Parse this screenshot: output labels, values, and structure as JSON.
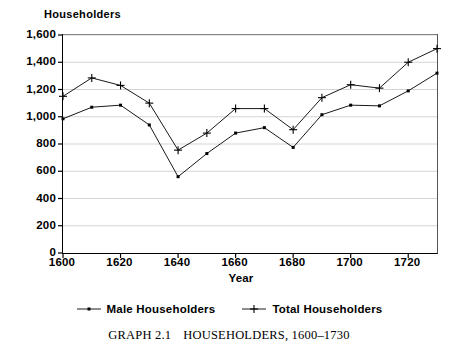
{
  "chart_data": {
    "type": "line",
    "title": "",
    "ylabel": "Householders",
    "xlabel": "Year",
    "xlim": [
      1600,
      1730
    ],
    "ylim": [
      0,
      1600
    ],
    "grid": true,
    "legend_position": "bottom",
    "x": [
      1600,
      1610,
      1620,
      1630,
      1640,
      1650,
      1660,
      1670,
      1680,
      1690,
      1700,
      1710,
      1720,
      1730
    ],
    "xticks": [
      "1600",
      "1620",
      "1640",
      "1660",
      "1680",
      "1700",
      "1720"
    ],
    "xtick_values": [
      1600,
      1620,
      1640,
      1660,
      1680,
      1700,
      1720
    ],
    "yticks": [
      "0",
      "200",
      "400",
      "600",
      "800",
      "1,000",
      "1,200",
      "1,400",
      "1,600"
    ],
    "ytick_values": [
      0,
      200,
      400,
      600,
      800,
      1000,
      1200,
      1400,
      1600
    ],
    "series": [
      {
        "name": "Male Householders",
        "marker": "dot",
        "color": "#000000",
        "values": [
          985,
          1070,
          1085,
          940,
          560,
          730,
          880,
          920,
          775,
          1015,
          1085,
          1080,
          1190,
          1320
        ]
      },
      {
        "name": "Total Householders",
        "marker": "plus",
        "color": "#000000",
        "values": [
          1150,
          1285,
          1230,
          1100,
          755,
          880,
          1060,
          1060,
          905,
          1140,
          1235,
          1210,
          1400,
          1500
        ]
      }
    ]
  },
  "caption": {
    "label": "GRAPH 2.1",
    "text": "HOUSEHOLDERS, 1600–1730"
  }
}
